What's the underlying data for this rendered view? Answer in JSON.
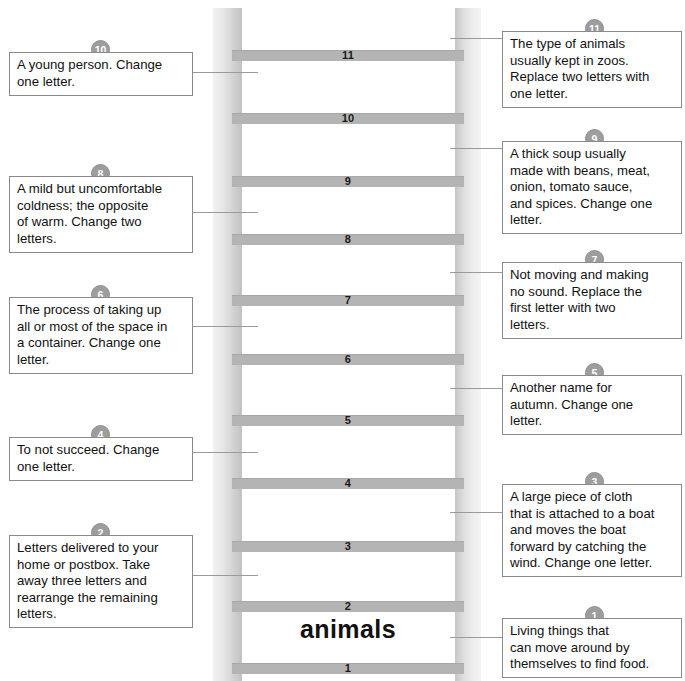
{
  "puzzle": {
    "type": "word-ladder",
    "bottom_word": "animals",
    "rungs": [
      {
        "number": "11",
        "y": 50
      },
      {
        "number": "10",
        "y": 113
      },
      {
        "number": "9",
        "y": 176
      },
      {
        "number": "8",
        "y": 234
      },
      {
        "number": "7",
        "y": 295
      },
      {
        "number": "6",
        "y": 354
      },
      {
        "number": "5",
        "y": 415
      },
      {
        "number": "4",
        "y": 478
      },
      {
        "number": "3",
        "y": 541
      },
      {
        "number": "2",
        "y": 601
      },
      {
        "number": "1",
        "y": 663
      }
    ]
  },
  "clues_left": [
    {
      "number": "10",
      "text": "A young person.  Change\none letter.",
      "box": {
        "x": 9,
        "y": 52,
        "w": 184,
        "h": 44
      },
      "badge": {
        "x": 91,
        "y": 40
      },
      "connector": {
        "x": 193,
        "y": 72,
        "w": 65
      }
    },
    {
      "number": "8",
      "text": "A mild but uncomfortable\ncoldness; the opposite\nof warm.  Change two\nletters.",
      "box": {
        "x": 9,
        "y": 176,
        "w": 184,
        "h": 77
      },
      "badge": {
        "x": 91,
        "y": 164
      },
      "connector": {
        "x": 193,
        "y": 212,
        "w": 65
      }
    },
    {
      "number": "6",
      "text": "The process of taking up\nall or most of the space in\na container.  Change one\nletter.",
      "box": {
        "x": 9,
        "y": 297,
        "w": 184,
        "h": 77
      },
      "badge": {
        "x": 91,
        "y": 285
      },
      "connector": {
        "x": 193,
        "y": 326,
        "w": 65
      }
    },
    {
      "number": "4",
      "text": "To not succeed.  Change\none letter.",
      "box": {
        "x": 9,
        "y": 437,
        "w": 184,
        "h": 44
      },
      "badge": {
        "x": 91,
        "y": 425
      },
      "connector": {
        "x": 193,
        "y": 452,
        "w": 65
      }
    },
    {
      "number": "2",
      "text": "Letters delivered to your\nhome or postbox.  Take\naway three letters and\nrearrange the remaining\nletters.",
      "box": {
        "x": 9,
        "y": 535,
        "w": 184,
        "h": 93
      },
      "badge": {
        "x": 91,
        "y": 523
      },
      "connector": {
        "x": 193,
        "y": 575,
        "w": 65
      }
    }
  ],
  "clues_right": [
    {
      "number": "11",
      "text": "The type of animals\nusually kept in zoos.\nReplace two letters with\none letter.",
      "box": {
        "x": 502,
        "y": 31,
        "w": 180,
        "h": 77
      },
      "badge": {
        "x": 585,
        "y": 19
      },
      "connector": {
        "x": 450,
        "y": 38,
        "w": 52
      }
    },
    {
      "number": "9",
      "text": "A thick soup usually\nmade with beans, meat,\nonion, tomato sauce,\nand spices.  Change one\nletter.",
      "box": {
        "x": 502,
        "y": 141,
        "w": 180,
        "h": 93
      },
      "badge": {
        "x": 585,
        "y": 129
      },
      "connector": {
        "x": 450,
        "y": 148,
        "w": 52
      }
    },
    {
      "number": "7",
      "text": "Not moving and making\nno sound.  Replace the\nfirst letter with two\nletters.",
      "box": {
        "x": 502,
        "y": 262,
        "w": 180,
        "h": 77
      },
      "badge": {
        "x": 585,
        "y": 250
      },
      "connector": {
        "x": 450,
        "y": 272,
        "w": 52
      }
    },
    {
      "number": "5",
      "text": "Another name for\nautumn.  Change one\nletter.",
      "box": {
        "x": 502,
        "y": 375,
        "w": 180,
        "h": 60
      },
      "badge": {
        "x": 585,
        "y": 363
      },
      "connector": {
        "x": 450,
        "y": 388,
        "w": 52
      }
    },
    {
      "number": "3",
      "text": "A large piece of cloth\nthat is attached to a boat\nand moves the boat\nforward by catching the\nwind.  Change one letter.",
      "box": {
        "x": 502,
        "y": 484,
        "w": 180,
        "h": 93
      },
      "badge": {
        "x": 585,
        "y": 472
      },
      "connector": {
        "x": 450,
        "y": 512,
        "w": 52
      }
    },
    {
      "number": "1",
      "text": "Living things that\ncan move around by\nthemselves to find food.",
      "box": {
        "x": 502,
        "y": 618,
        "w": 180,
        "h": 60
      },
      "badge": {
        "x": 585,
        "y": 606
      },
      "connector": {
        "x": 450,
        "y": 637,
        "w": 52
      }
    }
  ]
}
